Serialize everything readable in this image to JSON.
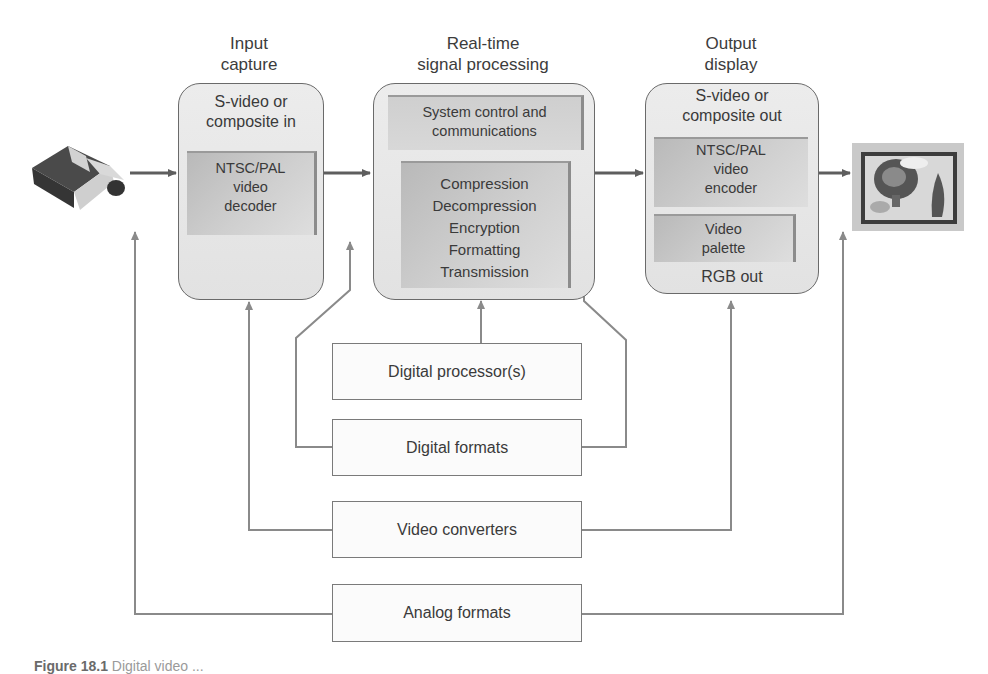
{
  "stages": [
    {
      "title": [
        "Input",
        "capture"
      ],
      "box_label": [
        "S-video or",
        "composite in"
      ],
      "inner_blocks": [
        {
          "lines": [
            "NTSC/PAL",
            "video",
            "decoder"
          ]
        }
      ]
    },
    {
      "title": [
        "Real-time",
        "signal processing"
      ],
      "inner_blocks": [
        {
          "lines": [
            "System control and",
            "communications"
          ]
        },
        {
          "lines": [
            "Compression",
            "Decompression",
            "Encryption",
            "Formatting",
            "Transmission"
          ]
        }
      ]
    },
    {
      "title": [
        "Output",
        "display"
      ],
      "box_label": [
        "S-video or",
        "composite out"
      ],
      "inner_blocks": [
        {
          "lines": [
            "NTSC/PAL",
            "video",
            "encoder"
          ]
        },
        {
          "lines": [
            "Video",
            "palette"
          ]
        }
      ],
      "bottom_label": "RGB out"
    }
  ],
  "support_boxes": [
    {
      "label": "Digital processor(s)"
    },
    {
      "label": "Digital formats"
    },
    {
      "label": "Video converters"
    },
    {
      "label": "Analog formats"
    }
  ],
  "icons": {
    "source": "video-camera-icon",
    "sink": "display-monitor-icon"
  },
  "caption": {
    "prefix": "Figure 18.1",
    "text": "Digital video ..."
  },
  "colors": {
    "line": "#6e6e6e",
    "box_fill": "#e6e6e6",
    "inner_fill": "#c4c4c4"
  }
}
